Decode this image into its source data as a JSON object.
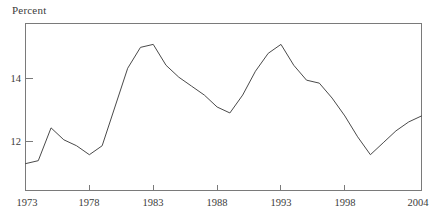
{
  "chart_data": {
    "type": "line",
    "title": "",
    "subtitle": "",
    "ylabel": "Percent",
    "xlabel": "",
    "ylim": [
      10.2,
      15.8
    ],
    "xlim": [
      1973,
      2004
    ],
    "grid": false,
    "legend": "none",
    "y_ticks": [
      12,
      14
    ],
    "y_tick_labels": [
      "12",
      "14"
    ],
    "x_ticks": [
      1973,
      1978,
      1983,
      1988,
      1993,
      1998,
      2004
    ],
    "x_tick_labels": [
      "1973",
      "1978",
      "1983",
      "1988",
      "1993",
      "1998",
      "2004"
    ],
    "series": [
      {
        "name": "Percent",
        "x": [
          1973,
          1974,
          1975,
          1976,
          1977,
          1978,
          1979,
          1980,
          1981,
          1982,
          1983,
          1984,
          1985,
          1986,
          1987,
          1988,
          1989,
          1990,
          1991,
          1992,
          1993,
          1994,
          1995,
          1996,
          1997,
          1998,
          1999,
          2000,
          2001,
          2002,
          2003,
          2004
        ],
        "values": [
          11.1,
          11.2,
          12.3,
          11.9,
          11.7,
          11.4,
          11.7,
          13.0,
          14.3,
          15.0,
          15.1,
          14.4,
          14.0,
          13.7,
          13.4,
          13.0,
          12.8,
          13.4,
          14.2,
          14.8,
          15.1,
          14.4,
          13.9,
          13.8,
          13.3,
          12.7,
          12.0,
          11.4,
          11.8,
          12.2,
          12.5,
          12.7
        ]
      }
    ]
  },
  "axis": {
    "y_label_top": "Percent"
  }
}
